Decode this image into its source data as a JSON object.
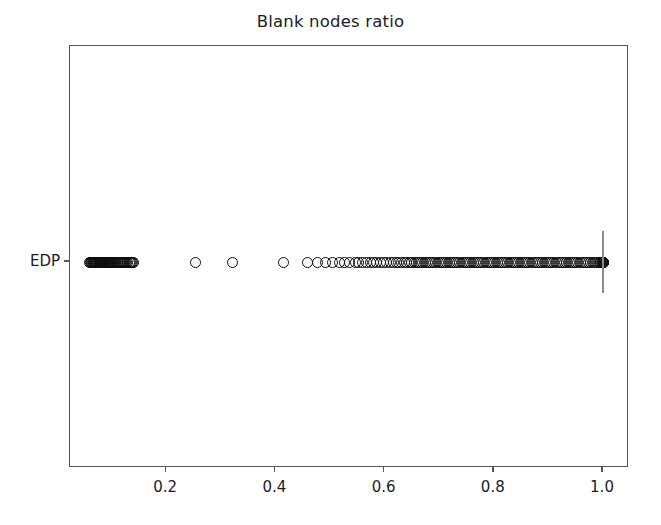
{
  "chart_data": {
    "type": "scatter",
    "title": "Blank nodes ratio",
    "xlabel": "",
    "ylabel": "",
    "xlim": [
      0.0233,
      1.0466
    ],
    "grid": false,
    "legend": null,
    "orientation": "horizontal",
    "categories": [
      "EDP"
    ],
    "xticks": [
      0.2,
      0.4,
      0.6,
      0.8,
      1.0
    ],
    "xticklabels": [
      "0.2",
      "0.4",
      "0.6",
      "0.8",
      "1.0"
    ],
    "yticklabels": [
      "EDP"
    ],
    "marker": "open-circle",
    "marker_color": "#0d0d0d",
    "reference_line": {
      "x": 1.0,
      "color": "#8a8a8a",
      "orientation": "vertical"
    },
    "series": [
      {
        "name": "EDP",
        "category": "EDP",
        "x": [
          0.06,
          0.062,
          0.063,
          0.064,
          0.065,
          0.066,
          0.067,
          0.068,
          0.069,
          0.07,
          0.071,
          0.072,
          0.073,
          0.074,
          0.075,
          0.076,
          0.077,
          0.078,
          0.079,
          0.08,
          0.081,
          0.082,
          0.083,
          0.084,
          0.085,
          0.086,
          0.087,
          0.088,
          0.089,
          0.09,
          0.091,
          0.092,
          0.093,
          0.094,
          0.095,
          0.096,
          0.097,
          0.098,
          0.099,
          0.1,
          0.102,
          0.104,
          0.106,
          0.108,
          0.11,
          0.112,
          0.114,
          0.116,
          0.118,
          0.12,
          0.122,
          0.124,
          0.126,
          0.128,
          0.13,
          0.132,
          0.134,
          0.136,
          0.138,
          0.14,
          0.253,
          0.322,
          0.415,
          0.459,
          0.478,
          0.492,
          0.505,
          0.518,
          0.527,
          0.536,
          0.546,
          0.553,
          0.56,
          0.567,
          0.574,
          0.58,
          0.586,
          0.592,
          0.598,
          0.604,
          0.61,
          0.616,
          0.621,
          0.626,
          0.631,
          0.636,
          0.641,
          0.646,
          0.65,
          0.654,
          0.658,
          0.662,
          0.666,
          0.67,
          0.674,
          0.678,
          0.682,
          0.686,
          0.69,
          0.694,
          0.698,
          0.702,
          0.706,
          0.71,
          0.714,
          0.718,
          0.722,
          0.726,
          0.73,
          0.734,
          0.738,
          0.742,
          0.746,
          0.75,
          0.754,
          0.758,
          0.762,
          0.766,
          0.77,
          0.774,
          0.778,
          0.782,
          0.786,
          0.79,
          0.794,
          0.798,
          0.802,
          0.806,
          0.81,
          0.814,
          0.818,
          0.822,
          0.826,
          0.83,
          0.834,
          0.838,
          0.842,
          0.846,
          0.85,
          0.854,
          0.858,
          0.862,
          0.866,
          0.87,
          0.874,
          0.878,
          0.882,
          0.886,
          0.89,
          0.894,
          0.898,
          0.902,
          0.906,
          0.91,
          0.914,
          0.918,
          0.922,
          0.926,
          0.93,
          0.934,
          0.938,
          0.942,
          0.946,
          0.95,
          0.954,
          0.958,
          0.962,
          0.966,
          0.97,
          0.974,
          0.978,
          0.982,
          0.986,
          0.99,
          0.993,
          0.996,
          0.998,
          0.999,
          1.0,
          1.0,
          1.0,
          1.0,
          1.0,
          1.0,
          1.0,
          1.0,
          1.0,
          1.0,
          1.0,
          1.0
        ],
        "y": "EDP"
      }
    ]
  },
  "axis": {
    "x_pixel_of_zero": 56,
    "x_pixels_per_unit": 546,
    "row_y_pixel": 216
  }
}
